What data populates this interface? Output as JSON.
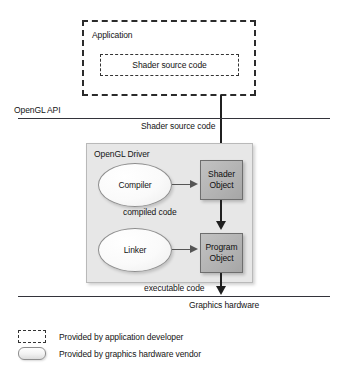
{
  "diagram": {
    "type": "flow-diagram",
    "layers": {
      "application": {
        "label": "Application",
        "inner_box_label": "Shader source code"
      },
      "api_boundary": {
        "label": "OpenGL API",
        "flow_label": "Shader source code"
      },
      "driver": {
        "label": "OpenGL Driver",
        "compiler_label": "Compiler",
        "linker_label": "Linker",
        "shader_object_line1": "Shader",
        "shader_object_line2": "Object",
        "program_object_line1": "Program",
        "program_object_line2": "Object",
        "compiled_code_label": "compiled code"
      },
      "hardware_boundary": {
        "label": "Graphics hardware",
        "flow_label": "executable code"
      }
    },
    "legend": {
      "items": [
        {
          "swatch": "dashed-rect",
          "label": "Provided by application developer"
        },
        {
          "swatch": "filled-rounded-rect",
          "label": "Provided by graphics hardware vendor"
        }
      ]
    },
    "colors": {
      "stroke_dark": "#2b2b2b",
      "driver_fill": "#e7e7e7",
      "object_fill": "#b5b5b5",
      "ellipse_fill": "#fafafa",
      "boundary_line": "#33333a"
    }
  }
}
